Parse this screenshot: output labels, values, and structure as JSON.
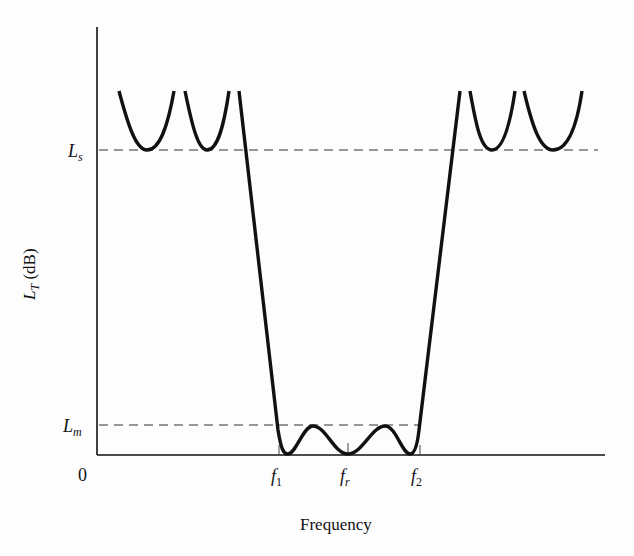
{
  "figure": {
    "y_axis_label_symbol": "L",
    "y_axis_label_sub": "T",
    "y_axis_label_unit": "(dB)",
    "x_axis_label": "Frequency",
    "origin_label": "0",
    "levels": [
      {
        "symbol": "L",
        "sub": "s",
        "meaning": "stopband level"
      },
      {
        "symbol": "L",
        "sub": "m",
        "meaning": "max passband ripple level"
      }
    ],
    "x_ticks": [
      {
        "symbol": "f",
        "sub": "1"
      },
      {
        "symbol": "f",
        "sub": "r"
      },
      {
        "symbol": "f",
        "sub": "2"
      }
    ]
  }
}
